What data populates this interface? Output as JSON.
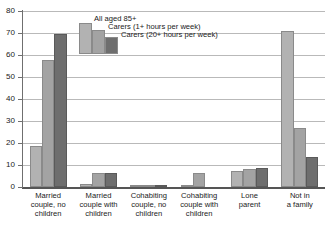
{
  "chart_data": {
    "type": "bar",
    "title": "",
    "subtitle": "",
    "xlabel": "",
    "ylabel": "",
    "ylim": [
      0,
      80
    ],
    "yticks": [
      0,
      10,
      20,
      30,
      40,
      50,
      60,
      70,
      80
    ],
    "grid": true,
    "legend_position": "top-center-inside",
    "categories": [
      "Married\ncouple, no\nchildren",
      "Married\ncouple with\nchildren",
      "Cohabiting\ncouple, no\nchildren",
      "Cohabiting\ncouple with\nchildren",
      "Lone\nparent",
      "Not in\na family"
    ],
    "series": [
      {
        "name": "All aged 85+",
        "color": "#b2b2b2",
        "values": [
          18.5,
          1.5,
          0.5,
          0.2,
          7.2,
          71.0
        ]
      },
      {
        "name": "Carers (1+ hours per week)",
        "color": "#a3a3a3",
        "values": [
          57.6,
          6.3,
          1.1,
          6.3,
          8.0,
          26.7
        ]
      },
      {
        "name": "Carers (20+ hours per week)",
        "color": "#6e6e6e",
        "values": [
          69.7,
          6.4,
          0.9,
          0.0,
          8.6,
          13.5
        ]
      }
    ]
  },
  "axis": {
    "y_tick_labels": [
      "0",
      "10",
      "20",
      "30",
      "40",
      "50",
      "60",
      "70",
      "80"
    ]
  },
  "legend": {
    "entries": [
      {
        "label": "All aged 85+"
      },
      {
        "label": "Carers (1+ hours per week)"
      },
      {
        "label": "Carers (20+ hours per week)"
      }
    ]
  }
}
